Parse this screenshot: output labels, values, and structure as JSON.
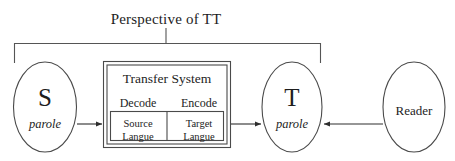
{
  "diagram": {
    "title": "Perspective of TT",
    "scope_bracket": {
      "label": "scope-bracket",
      "covers": [
        "S",
        "Transfer System",
        "T"
      ]
    },
    "nodes": {
      "source": {
        "main_label": "S",
        "sub_label": "parole",
        "shape": "ellipse"
      },
      "target": {
        "main_label": "T",
        "sub_label": "parole",
        "shape": "ellipse"
      },
      "reader": {
        "main_label": "Reader",
        "shape": "ellipse"
      }
    },
    "transfer_system": {
      "title": "Transfer System",
      "phases": {
        "decode": "Decode",
        "encode": "Encode"
      },
      "cells": {
        "source_langue": {
          "line1": "Source",
          "line2": "Langue"
        },
        "target_langue": {
          "line1": "Target",
          "line2": "Langue"
        }
      }
    },
    "arrows": [
      {
        "name": "arrow-source-to-transfer",
        "from": "S",
        "to": "Transfer System",
        "direction": "right"
      },
      {
        "name": "arrow-transfer-to-target",
        "from": "Transfer System",
        "to": "T",
        "direction": "right"
      },
      {
        "name": "arrow-reader-to-target",
        "from": "Reader",
        "to": "T",
        "direction": "left"
      }
    ],
    "colors": {
      "stroke": "#3a3a3a",
      "text": "#1d1d1d",
      "background": "#ffffff"
    }
  }
}
